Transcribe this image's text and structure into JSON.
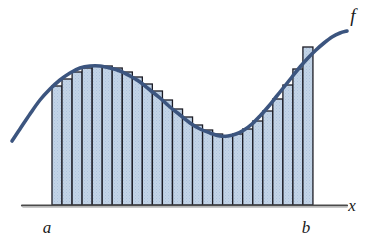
{
  "figure": {
    "background_color": "#ffffff"
  },
  "labels": {
    "function_label": "f",
    "axis_label_x": "x",
    "lower_limit_label": "a",
    "upper_limit_label": "b"
  },
  "colors": {
    "curve": "#3c557f",
    "rect_fill": "#bfd1e6",
    "rect_stroke": "#1b1b24",
    "axis": "#4a4a4a",
    "text": "#1a1a1a"
  },
  "chart_data": {
    "type": "area",
    "xlabel": "x",
    "ylabel": "",
    "grid": false,
    "legend": "none",
    "axis": {
      "x_start_px": 22,
      "x_end_px": 347,
      "baseline_y_px": 205,
      "a_px": 52,
      "b_px": 313
    },
    "interval": {
      "a_label": "a",
      "b_label": "b",
      "n_rectangles": 26,
      "rect_width_px": 10.04
    },
    "curve_points_px": [
      [
        12,
        141
      ],
      [
        20,
        129
      ],
      [
        30,
        114
      ],
      [
        40,
        100
      ],
      [
        50,
        89
      ],
      [
        60,
        80
      ],
      [
        70,
        73
      ],
      [
        80,
        68
      ],
      [
        90,
        66
      ],
      [
        100,
        66
      ],
      [
        110,
        68
      ],
      [
        120,
        71
      ],
      [
        130,
        76
      ],
      [
        140,
        82
      ],
      [
        150,
        90
      ],
      [
        160,
        98
      ],
      [
        170,
        107
      ],
      [
        180,
        115
      ],
      [
        190,
        123
      ],
      [
        200,
        129
      ],
      [
        210,
        133
      ],
      [
        220,
        136
      ],
      [
        228,
        136
      ],
      [
        236,
        134
      ],
      [
        244,
        130
      ],
      [
        252,
        124
      ],
      [
        260,
        116
      ],
      [
        268,
        107
      ],
      [
        276,
        97
      ],
      [
        284,
        87
      ],
      [
        292,
        77
      ],
      [
        300,
        67
      ],
      [
        308,
        58
      ],
      [
        316,
        50
      ],
      [
        324,
        43
      ],
      [
        332,
        37
      ],
      [
        340,
        33
      ],
      [
        347,
        31
      ]
    ],
    "rectangles": [
      {
        "index": 1,
        "x_left_px": 52.0,
        "top_y_px": 86
      },
      {
        "index": 2,
        "x_left_px": 62.0,
        "top_y_px": 79
      },
      {
        "index": 3,
        "x_left_px": 72.1,
        "top_y_px": 72
      },
      {
        "index": 4,
        "x_left_px": 82.1,
        "top_y_px": 68
      },
      {
        "index": 5,
        "x_left_px": 92.2,
        "top_y_px": 66
      },
      {
        "index": 6,
        "x_left_px": 102.2,
        "top_y_px": 66
      },
      {
        "index": 7,
        "x_left_px": 112.2,
        "top_y_px": 68
      },
      {
        "index": 8,
        "x_left_px": 122.3,
        "top_y_px": 72
      },
      {
        "index": 9,
        "x_left_px": 132.3,
        "top_y_px": 77
      },
      {
        "index": 10,
        "x_left_px": 142.3,
        "top_y_px": 84
      },
      {
        "index": 11,
        "x_left_px": 152.4,
        "top_y_px": 91
      },
      {
        "index": 12,
        "x_left_px": 162.4,
        "top_y_px": 100
      },
      {
        "index": 13,
        "x_left_px": 172.5,
        "top_y_px": 109
      },
      {
        "index": 14,
        "x_left_px": 182.5,
        "top_y_px": 117
      },
      {
        "index": 15,
        "x_left_px": 192.5,
        "top_y_px": 125
      },
      {
        "index": 16,
        "x_left_px": 202.6,
        "top_y_px": 130
      },
      {
        "index": 17,
        "x_left_px": 212.6,
        "top_y_px": 134
      },
      {
        "index": 18,
        "x_left_px": 222.6,
        "top_y_px": 136
      },
      {
        "index": 19,
        "x_left_px": 232.7,
        "top_y_px": 134
      },
      {
        "index": 20,
        "x_left_px": 242.7,
        "top_y_px": 129
      },
      {
        "index": 21,
        "x_left_px": 252.8,
        "top_y_px": 121
      },
      {
        "index": 22,
        "x_left_px": 262.8,
        "top_y_px": 111
      },
      {
        "index": 23,
        "x_left_px": 272.8,
        "top_y_px": 99
      },
      {
        "index": 24,
        "x_left_px": 282.9,
        "top_y_px": 85
      },
      {
        "index": 25,
        "x_left_px": 292.9,
        "top_y_px": 69
      },
      {
        "index": 26,
        "x_left_px": 302.9,
        "top_y_px": 47
      }
    ],
    "label_positions_px": {
      "f": [
        353,
        22
      ],
      "x": [
        352,
        211
      ],
      "a": [
        47,
        233
      ],
      "b": [
        306,
        233
      ]
    }
  }
}
